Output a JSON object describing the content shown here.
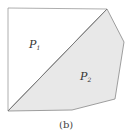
{
  "figure": {
    "caption": "(b)",
    "regions": [
      {
        "name": "P",
        "subscript": "1",
        "fill": "#ffffff"
      },
      {
        "name": "P",
        "subscript": "2",
        "fill": "#e8e8e8"
      }
    ],
    "stroke_color": "#888888"
  }
}
